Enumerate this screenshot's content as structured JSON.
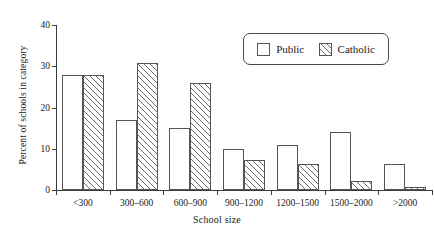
{
  "chart_data": {
    "type": "bar",
    "title": "",
    "xlabel": "School size",
    "ylabel": "Percent of schools in category",
    "categories": [
      "<300",
      "300–600",
      "600–900",
      "900–1200",
      "1200–1500",
      "1500–2000",
      ">2000"
    ],
    "series": [
      {
        "name": "Public",
        "values": [
          28,
          17,
          15,
          10,
          11,
          14,
          6.2
        ]
      },
      {
        "name": "Catholic",
        "values": [
          28,
          30.8,
          26,
          7.3,
          6.3,
          2.2,
          0.7
        ]
      }
    ],
    "ylim": [
      0,
      40
    ],
    "yticks": [
      0,
      10,
      20,
      30,
      40
    ],
    "ytick_labels": [
      "0",
      "10",
      "20",
      "30",
      "40"
    ],
    "grid": false,
    "legend_position": "top-right",
    "legend_entries": [
      "Public",
      "Catholic"
    ],
    "series_styles": [
      "open",
      "hatched"
    ],
    "colors": {
      "axis": "#3c3c3c",
      "bar_edge": "#555555",
      "hatch": "#6a6a6a",
      "background": "#ffffff",
      "text": "#1a1a1a"
    }
  }
}
